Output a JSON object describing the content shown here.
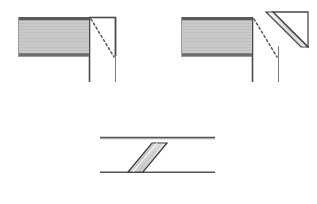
{
  "figure": {
    "canvas": {
      "width": 317,
      "height": 204,
      "background": "#ffffff"
    },
    "colors": {
      "outline": "#3b3b3b",
      "outline_light": "#8a8a8a",
      "hatch_fill": "#c9c9c9",
      "hatch_line": "#b4b4b4",
      "band_fill": "#d0d0d0",
      "band_highlight": "#efefef",
      "white_face": "#ffffff",
      "dash_line": "#555555"
    },
    "panels": [
      {
        "id": "panel-1",
        "name": "corner-before-cut",
        "caption": "",
        "description": "L-shaped corner with dashed mitre line marked across the corner square",
        "elements": [
          {
            "name": "horizontal-member",
            "kind": "hatched-rectangle",
            "x": 18,
            "y": 17,
            "width": 71,
            "height": 39
          },
          {
            "name": "vertical-member",
            "kind": "white-rectangle",
            "x": 89,
            "y": 17,
            "width": 27,
            "height": 65
          },
          {
            "name": "mitre-dashed-line",
            "kind": "dashed-diagonal",
            "x1": 90,
            "y1": 18,
            "x2": 115,
            "y2": 59
          }
        ]
      },
      {
        "id": "panel-2",
        "name": "corner-folded-open",
        "caption": "",
        "description": "Same corner with triangular flap rotated outward about the mitre line, band visible on cut face",
        "elements": [
          {
            "name": "horizontal-member",
            "kind": "hatched-rectangle",
            "x": 181,
            "y": 17,
            "width": 71,
            "height": 39
          },
          {
            "name": "vertical-member",
            "kind": "white-rectangle",
            "x": 252,
            "y": 17,
            "width": 27,
            "height": 65
          },
          {
            "name": "mitre-dashed-line",
            "kind": "dashed-diagonal",
            "x1": 253,
            "y1": 18,
            "x2": 278,
            "y2": 59
          },
          {
            "name": "rotated-triangle-flap",
            "kind": "triangle-white",
            "points": "272,12 307,12 307,46"
          },
          {
            "name": "cut-face-band",
            "kind": "parallelogram-band",
            "points": "266,12 272,12 307,46 301,46"
          }
        ]
      },
      {
        "id": "panel-3",
        "name": "strip-with-mitre-cut",
        "caption": "",
        "description": "Unfolded strip viewed flat showing the diagonal mitre band across its width",
        "elements": [
          {
            "name": "strip-top-edge",
            "kind": "horizontal-line",
            "x1": 100,
            "y1": 137,
            "x2": 215,
            "y2": 137
          },
          {
            "name": "strip-bottom-edge",
            "kind": "horizontal-line",
            "x1": 100,
            "y1": 172,
            "x2": 215,
            "y2": 172
          },
          {
            "name": "diagonal-band",
            "kind": "parallelogram-band",
            "points": "128,172 152,144 167,144 143,172"
          }
        ]
      }
    ]
  }
}
